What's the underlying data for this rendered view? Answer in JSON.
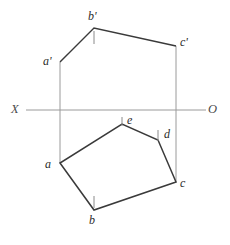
{
  "diagram": {
    "type": "orthographic-projection",
    "canvas": {
      "width": 230,
      "height": 245,
      "background": "#ffffff"
    },
    "colors": {
      "outline": "#3a3a3a",
      "projection_line": "#9a9a9a",
      "axis_line": "#9a9a9a",
      "tick": "#8a8a8a",
      "label_text": "#2b2b2b",
      "axis_text": "#4a4a4a"
    },
    "axis": {
      "name": "XO-axis",
      "y": 110,
      "x_start": 26,
      "x_end": 206,
      "left_label": "X",
      "right_label": "O",
      "left_label_pos": {
        "x": 11,
        "y": 103
      },
      "right_label_pos": {
        "x": 208,
        "y": 103
      }
    },
    "front_view": {
      "name": "front-view-polygon",
      "label_suffix": "prime",
      "points": "60,62 94,28 176,46 176,110 60,110",
      "visible_edges": [
        {
          "from": "a'",
          "to": "b'",
          "x1": 60,
          "y1": 62,
          "x2": 94,
          "y2": 28
        },
        {
          "from": "b'",
          "to": "c'",
          "x1": 94,
          "y1": 28,
          "x2": 176,
          "y2": 46
        }
      ],
      "vertices": [
        {
          "id": "a-prime",
          "label": "a'",
          "x": 60,
          "y": 62,
          "label_x": 43,
          "label_y": 55
        },
        {
          "id": "b-prime",
          "label": "b'",
          "x": 94,
          "y": 28,
          "label_x": 88,
          "label_y": 10
        },
        {
          "id": "c-prime",
          "label": "c'",
          "x": 176,
          "y": 46,
          "label_x": 180,
          "label_y": 36
        }
      ],
      "ticks": [
        {
          "id": "b-prime-tick",
          "x": 94,
          "y1": 31,
          "y2": 44
        }
      ]
    },
    "top_view": {
      "name": "top-view-polygon",
      "points": "60,163 94,210 176,182 158,140 122,124",
      "vertices": [
        {
          "id": "a",
          "label": "a",
          "x": 60,
          "y": 163,
          "label_x": 45,
          "label_y": 158
        },
        {
          "id": "b",
          "label": "b",
          "x": 94,
          "y": 210,
          "label_x": 89,
          "label_y": 214
        },
        {
          "id": "c",
          "label": "c",
          "x": 176,
          "y": 182,
          "label_x": 180,
          "label_y": 177
        },
        {
          "id": "d",
          "label": "d",
          "x": 158,
          "y": 140,
          "label_x": 164,
          "label_y": 128
        },
        {
          "id": "e",
          "label": "e",
          "x": 122,
          "y": 124,
          "label_x": 127,
          "label_y": 114
        }
      ],
      "ticks": [
        {
          "id": "e-tick",
          "x": 122,
          "y1": 117,
          "y2": 126
        },
        {
          "id": "d-tick",
          "x": 158,
          "y1": 130,
          "y2": 141
        },
        {
          "id": "b-tick",
          "x": 94,
          "y1": 196,
          "y2": 208
        }
      ]
    },
    "projection_lines": [
      {
        "id": "projector-left",
        "x": 60,
        "y1": 62,
        "y2": 163
      },
      {
        "id": "projector-right",
        "x": 176,
        "y1": 46,
        "y2": 182
      }
    ]
  }
}
